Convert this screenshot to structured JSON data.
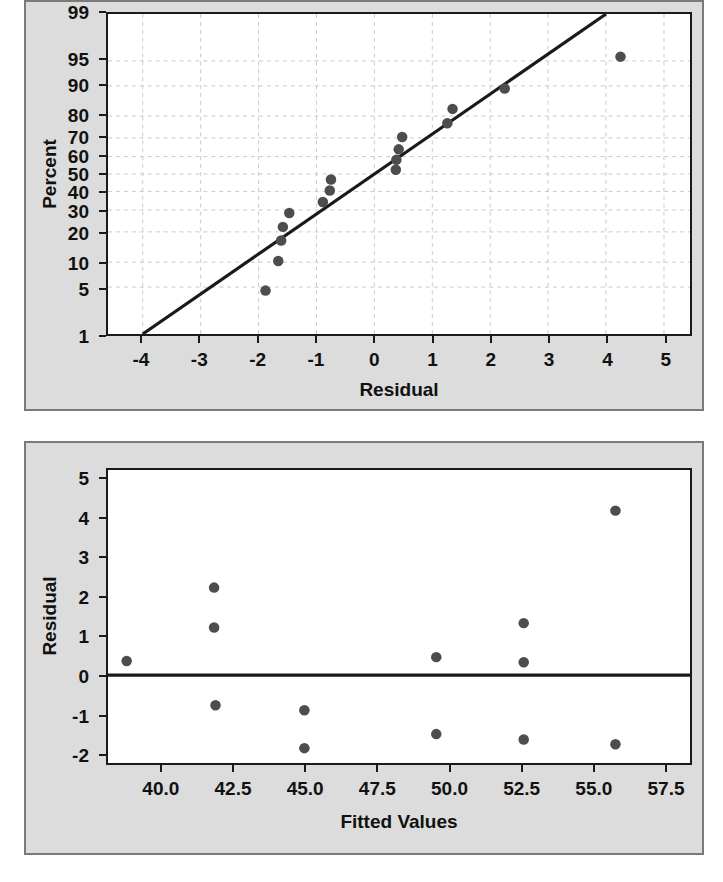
{
  "figure": {
    "background_color": "#ffffff",
    "panel_background_color": "#dcdcdc",
    "panel_border_color": "#7a7a7a",
    "plot_background_color": "#ffffff",
    "axis_color": "#1a1a1a",
    "marker_color": "#4d4d4d",
    "line_color": "#1a1a1a",
    "grid_color": "#c8c8d2"
  },
  "chart_data": [
    {
      "id": "normal-probability-plot",
      "type": "scatter",
      "title": "",
      "subtitle": "",
      "xlabel": "Residual",
      "ylabel": "Percent",
      "grid": true,
      "legend": "none",
      "xlim": [
        -4.6,
        5.45
      ],
      "ylim_percent": [
        1,
        99
      ],
      "yscale": "normal-probability",
      "xticks": [
        -4,
        -3,
        -2,
        -1,
        0,
        1,
        2,
        3,
        4,
        5
      ],
      "xticklabels": [
        "-4",
        "-3",
        "-2",
        "-1",
        "0",
        "1",
        "2",
        "3",
        "4",
        "5"
      ],
      "yticks": [
        1,
        5,
        10,
        20,
        30,
        40,
        50,
        60,
        70,
        80,
        90,
        95,
        99
      ],
      "yticklabels": [
        "1",
        "5",
        "10",
        "20",
        "30",
        "40",
        "50",
        "60",
        "70",
        "80",
        "90",
        "95",
        "99"
      ],
      "reference_line": {
        "x": [
          -4.0,
          4.0
        ],
        "percent": [
          1,
          99
        ]
      },
      "points": [
        {
          "x": -1.88,
          "percent": 4.5
        },
        {
          "x": -1.66,
          "percent": 10.3
        },
        {
          "x": -1.61,
          "percent": 16.7
        },
        {
          "x": -1.58,
          "percent": 22.1
        },
        {
          "x": -1.47,
          "percent": 28.5
        },
        {
          "x": -0.89,
          "percent": 34.2
        },
        {
          "x": -0.77,
          "percent": 40.5
        },
        {
          "x": -0.75,
          "percent": 46.8
        },
        {
          "x": 0.37,
          "percent": 52.5
        },
        {
          "x": 0.38,
          "percent": 58.2
        },
        {
          "x": 0.42,
          "percent": 64.0
        },
        {
          "x": 0.48,
          "percent": 70.5
        },
        {
          "x": 1.26,
          "percent": 77.0
        },
        {
          "x": 1.35,
          "percent": 82.8
        },
        {
          "x": 2.25,
          "percent": 89.3
        },
        {
          "x": 4.25,
          "percent": 95.6
        }
      ]
    },
    {
      "id": "residuals-vs-fitted-values",
      "type": "scatter",
      "title": "",
      "subtitle": "",
      "xlabel": "Fitted Values",
      "ylabel": "Residual",
      "grid": false,
      "legend": "none",
      "xlim": [
        38.1,
        58.4
      ],
      "ylim": [
        -2.25,
        5.25
      ],
      "xticks": [
        40.0,
        42.5,
        45.0,
        47.5,
        50.0,
        52.5,
        55.0,
        57.5
      ],
      "xticklabels": [
        "40.0",
        "42.5",
        "45.0",
        "47.5",
        "50.0",
        "52.5",
        "55.0",
        "57.5"
      ],
      "yticks": [
        5,
        4,
        3,
        2,
        1,
        0,
        -1,
        -2
      ],
      "yticklabels": [
        "5",
        "4",
        "3",
        "2",
        "1",
        "0",
        "-1",
        "-2"
      ],
      "reference_line": {
        "y": 0
      },
      "points": [
        {
          "x": 38.75,
          "y": 0.36
        },
        {
          "x": 41.8,
          "y": 2.24
        },
        {
          "x": 41.8,
          "y": 1.22
        },
        {
          "x": 41.85,
          "y": -0.77
        },
        {
          "x": 44.95,
          "y": -0.9
        },
        {
          "x": 44.95,
          "y": -1.87
        },
        {
          "x": 49.55,
          "y": 0.46
        },
        {
          "x": 49.55,
          "y": -1.51
        },
        {
          "x": 52.6,
          "y": 1.33
        },
        {
          "x": 52.6,
          "y": 0.33
        },
        {
          "x": 52.6,
          "y": -1.65
        },
        {
          "x": 55.8,
          "y": 4.21
        },
        {
          "x": 55.8,
          "y": -1.77
        }
      ]
    }
  ]
}
